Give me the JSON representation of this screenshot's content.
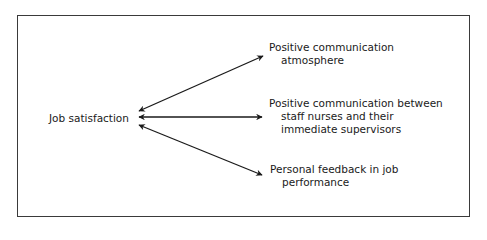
{
  "diagram": {
    "center": {
      "label": "Job satisfaction"
    },
    "targets": [
      {
        "line1": "Positive communication",
        "line2": "atmosphere"
      },
      {
        "line1": "Positive communication between",
        "line2": "staff nurses and their",
        "line3": "immediate supervisors"
      },
      {
        "line1": "Personal feedback in job",
        "line2": "performance"
      }
    ],
    "relation": "bidirectional-arrow"
  }
}
